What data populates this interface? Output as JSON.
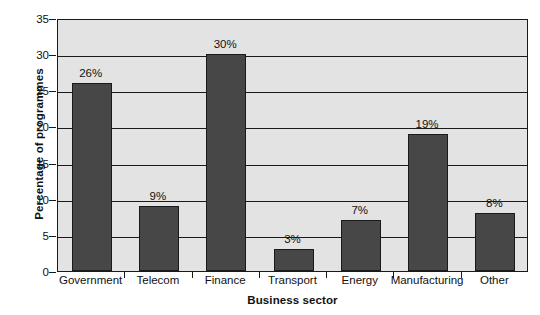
{
  "chart_data": {
    "type": "bar",
    "title": "",
    "xlabel": "Business sector",
    "ylabel": "Percentage of programmes",
    "categories": [
      "Government",
      "Telecom",
      "Finance",
      "Transport",
      "Energy",
      "Manufacturing",
      "Other"
    ],
    "values": [
      26,
      9,
      30,
      3,
      7,
      19,
      8
    ],
    "data_labels": [
      "26%",
      "9%",
      "30%",
      "3%",
      "7%",
      "19%",
      "8%"
    ],
    "ylim": [
      0,
      35
    ],
    "ytick_labels": [
      "0",
      "5",
      "10",
      "15",
      "20",
      "25",
      "30",
      "35"
    ],
    "ytick_values": [
      0,
      5,
      10,
      15,
      20,
      25,
      30,
      35
    ],
    "grid": true,
    "legend": null,
    "colors": {
      "bar_fill": "#474747",
      "bar_border": "#1a1a1a",
      "plot_background": "#e3e3e3",
      "axis": "#1a1a1a",
      "text": "#111111",
      "page_background": "#ffffff"
    }
  }
}
